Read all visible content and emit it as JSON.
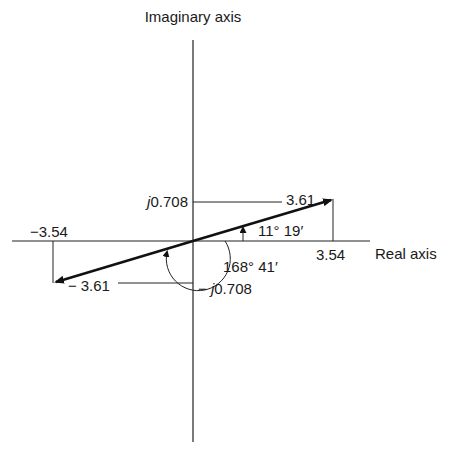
{
  "diagram": {
    "axes": {
      "imaginary_label": "Imaginary axis",
      "real_label": "Real axis"
    },
    "vectors": [
      {
        "name": "vector-positive",
        "real": 3.54,
        "imag": 0.708,
        "magnitude_label": "3.61",
        "angle_label": "11° 19′"
      },
      {
        "name": "vector-negative",
        "real": -3.54,
        "imag": -0.708,
        "magnitude_label": "3.61",
        "angle_label": "168° 41′"
      }
    ],
    "labels": {
      "real_pos": "3.54",
      "real_neg": "−3.54",
      "imag_pos_j": "j",
      "imag_pos_val": "0.708",
      "imag_neg_prefix": "− ",
      "imag_neg_j": "j",
      "imag_neg_val": "0.708",
      "mag_pos": "3.61",
      "mag_neg_prefix": "−",
      "mag_neg": "3.61",
      "angle_small": "11° 19′",
      "angle_large": "168° 41′"
    }
  }
}
